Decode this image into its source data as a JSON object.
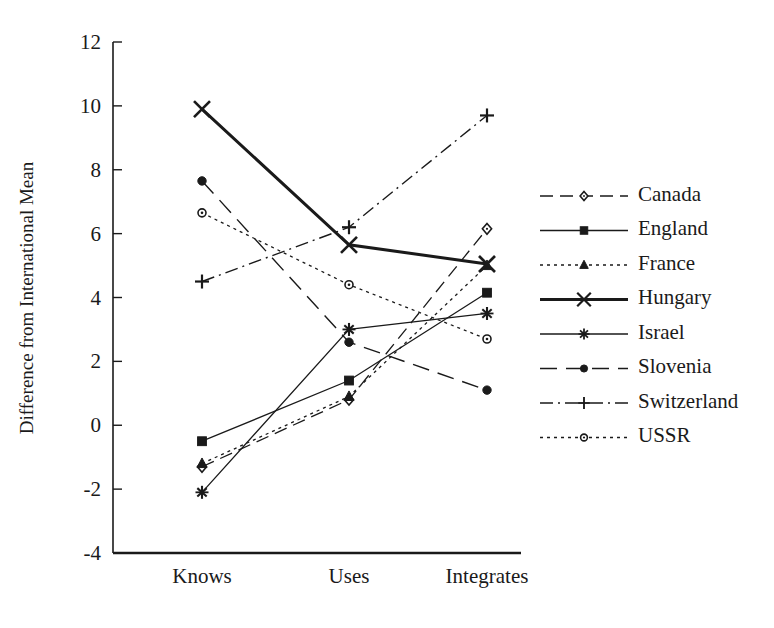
{
  "chart_data": {
    "type": "line",
    "title": "",
    "xlabel": "",
    "ylabel": "Difference from International Mean",
    "categories": [
      "Knows",
      "Uses",
      "Integrates"
    ],
    "ylim": [
      -4,
      12
    ],
    "ytick_labels": [
      "12",
      "10",
      "8",
      "6",
      "4",
      "2",
      "0",
      "-2",
      "-4"
    ],
    "yticks": [
      12,
      10,
      8,
      6,
      4,
      2,
      0,
      -2,
      -4
    ],
    "grid": false,
    "legend_position": "right",
    "series": [
      {
        "name": "Canada",
        "values": [
          -1.3,
          0.8,
          6.15
        ],
        "marker": "open-diamond",
        "line_style": "dashed",
        "line_width": 1.3,
        "color": "#1a1a1a"
      },
      {
        "name": "England",
        "values": [
          -0.5,
          1.4,
          4.15
        ],
        "marker": "filled-square",
        "line_style": "solid",
        "line_width": 1.3,
        "color": "#1a1a1a"
      },
      {
        "name": "France",
        "values": [
          -1.2,
          0.9,
          5.0
        ],
        "marker": "filled-triangle",
        "line_style": "dotted",
        "line_width": 1.3,
        "color": "#1a1a1a"
      },
      {
        "name": "Hungary",
        "values": [
          9.9,
          5.65,
          5.05
        ],
        "marker": "cross-x",
        "line_style": "solid",
        "line_width": 3.0,
        "color": "#1a1a1a"
      },
      {
        "name": "Israel",
        "values": [
          -2.1,
          3.0,
          3.5
        ],
        "marker": "asterisk",
        "line_style": "solid",
        "line_width": 1.3,
        "color": "#1a1a1a"
      },
      {
        "name": "Slovenia",
        "values": [
          7.65,
          2.6,
          1.1
        ],
        "marker": "filled-circle",
        "line_style": "long-dash",
        "line_width": 1.4,
        "color": "#1a1a1a"
      },
      {
        "name": "Switzerland",
        "values": [
          4.5,
          6.2,
          9.7
        ],
        "marker": "plus",
        "line_style": "dash-dot",
        "line_width": 1.4,
        "color": "#1a1a1a"
      },
      {
        "name": "USSR",
        "values": [
          6.65,
          4.4,
          2.7
        ],
        "marker": "open-circle",
        "line_style": "dotted",
        "line_width": 1.3,
        "color": "#1a1a1a"
      }
    ]
  }
}
